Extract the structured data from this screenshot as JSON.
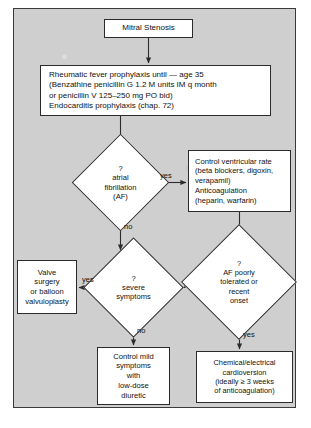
{
  "figure": {
    "panel_background": "#cfcfcf",
    "node_fill": "#ffffff",
    "line_color": "#2b2b2b",
    "text_color": "#111111"
  },
  "nodes": {
    "mitral_stenosis": {
      "shape": "box",
      "text": "Mitral Stenosis"
    },
    "prophylaxis": {
      "shape": "box",
      "text": "Rheumatic fever prophylaxis until — age 35\n  (Benzathine penicillin G 1.2 M units IM q month\n  or penicillin V 125–250 mg PO bid)\nEndocarditis prophylaxis (chap. 72)"
    },
    "af_question": {
      "shape": "diamond",
      "text": "?\natrial\nfibrillation\n(AF)"
    },
    "rate_control": {
      "shape": "box",
      "text": "Control ventricular rate\n  (beta blockers, digoxin,\n  verapamil)\nAnticoagulation\n  (heparin, warfarin)"
    },
    "af_tolerated": {
      "shape": "diamond",
      "text": "?\nAF poorly\ntolerated or\nrecent\nonset"
    },
    "severe_symptoms": {
      "shape": "diamond",
      "text": "?\nsevere\nsymptoms"
    },
    "valve_surgery": {
      "shape": "box",
      "text": "Valve\nsurgery\nor balloon\nvalvuloplasty"
    },
    "mild_symptoms": {
      "shape": "box",
      "text": "Control mild\nsymptoms\nwith\nlow-dose\ndiuretic"
    },
    "cardioversion": {
      "shape": "box",
      "text": "Chemical/electrical\ncardioversion\n(ideally ≥ 3 weeks\nof anticoagulation)"
    }
  },
  "edge_labels": {
    "af_yes": "yes",
    "af_no": "no",
    "severe_yes": "yes",
    "severe_no": "no",
    "tolerated_yes": "yes"
  },
  "edges": [
    {
      "from": "mitral_stenosis",
      "to": "prophylaxis",
      "label": ""
    },
    {
      "from": "prophylaxis",
      "to": "af_question",
      "label": ""
    },
    {
      "from": "af_question",
      "to": "rate_control",
      "label": "yes"
    },
    {
      "from": "af_question",
      "to": "severe_symptoms",
      "label": "no"
    },
    {
      "from": "rate_control",
      "to": "af_tolerated",
      "label": ""
    },
    {
      "from": "af_tolerated",
      "to": "cardioversion",
      "label": "yes"
    },
    {
      "from": "af_tolerated",
      "to": "severe_symptoms",
      "label": ""
    },
    {
      "from": "severe_symptoms",
      "to": "valve_surgery",
      "label": "yes"
    },
    {
      "from": "severe_symptoms",
      "to": "mild_symptoms",
      "label": "no"
    }
  ]
}
